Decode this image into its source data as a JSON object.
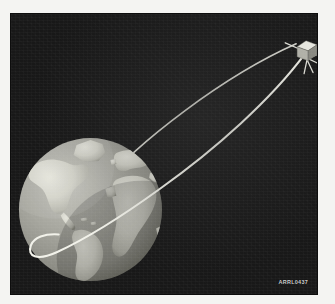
{
  "figure": {
    "caption": "ARRL0437",
    "background_color": "#181818",
    "panel": {
      "left": 10,
      "top": 13,
      "width": 308,
      "height": 282
    }
  },
  "earth": {
    "label": "Earth",
    "ocean_color": "#9b9b93",
    "land_color": "#d6d6cd",
    "shadow_color": "#6d6d66",
    "center_x": 90,
    "center_y": 210,
    "radius": 72,
    "view": "Atlantic-centered",
    "landmasses": [
      "North America",
      "South America",
      "Greenland",
      "Europe",
      "Africa"
    ]
  },
  "satellite": {
    "label": "Satellite",
    "body_shape": "cube",
    "body_color": "#d9d9d2",
    "shade_color": "#8e8e86",
    "antenna_color": "#e6e6de",
    "antenna_count": 5,
    "x": 297,
    "y": 38,
    "size": 22
  },
  "orbit": {
    "label": "Orbit path",
    "color": "#f0f0e8",
    "line_width": 2,
    "type": "elliptical",
    "apogee_at": "satellite",
    "perigee_at": "lower-left of Earth",
    "passes_behind_earth": true
  },
  "elements": {
    "sky_name": "night-sky-background",
    "earth_name": "earth-globe",
    "satellite_name": "satellite-icon",
    "orbit_name": "orbit-path"
  }
}
